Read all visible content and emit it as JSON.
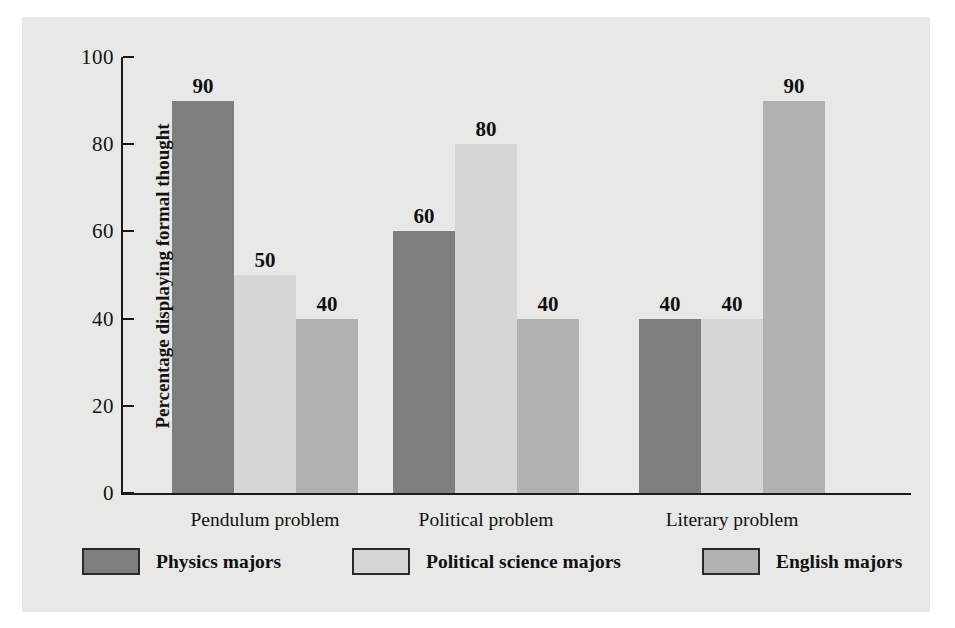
{
  "chart_data": {
    "type": "bar",
    "title": "",
    "xlabel": "",
    "ylabel": "Percentage displaying formal thought",
    "ylim": [
      0,
      100
    ],
    "yticks": [
      0,
      20,
      40,
      60,
      80,
      100
    ],
    "grid": false,
    "legend_position": "bottom",
    "categories": [
      "Pendulum problem",
      "Political problem",
      "Literary problem"
    ],
    "series": [
      {
        "name": "Physics majors",
        "color": "#7e7e7c",
        "values": [
          90,
          60,
          40
        ]
      },
      {
        "name": "Political science majors",
        "color": "#d6d6d2",
        "values": [
          50,
          80,
          40
        ]
      },
      {
        "name": "English majors",
        "color": "#b1b1ad",
        "values": [
          40,
          40,
          90
        ]
      }
    ],
    "bar_labels": [
      [
        "90",
        "50",
        "40"
      ],
      [
        "60",
        "80",
        "40"
      ],
      [
        "40",
        "40",
        "90"
      ]
    ]
  },
  "axis": {
    "y_title": "Percentage displaying formal thought",
    "tick_labels": [
      "100",
      "80",
      "60",
      "40",
      "20",
      "0"
    ]
  },
  "categories": [
    {
      "label": "Pendulum problem"
    },
    {
      "label": "Political problem"
    },
    {
      "label": "Literary problem"
    }
  ],
  "legend": {
    "items": [
      {
        "label": "Physics majors",
        "color": "#7e7e7c"
      },
      {
        "label": "Political science majors",
        "color": "#d6d6d2"
      },
      {
        "label": "English majors",
        "color": "#b1b1ad"
      }
    ]
  },
  "colors": {
    "background": "#e8e8e6",
    "axis": "#1a1a1a",
    "text": "#111111",
    "series_dark": "#7e7e7c",
    "series_light": "#d6d6d2",
    "series_medium": "#b1b1ad"
  }
}
